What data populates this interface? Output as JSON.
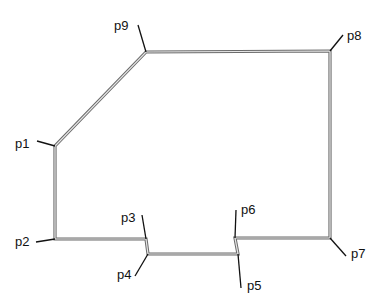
{
  "diagram": {
    "type": "polygon-outline",
    "outline_color_outer": "#6b6b6b",
    "outline_color_inner": "#e6e6e6",
    "leader_color": "#111111",
    "points": [
      {
        "id": "p1",
        "label": "p1",
        "vertex": [
          55,
          146
        ],
        "leader_end": [
          37,
          141
        ],
        "label_pos": [
          15,
          137
        ]
      },
      {
        "id": "p2",
        "label": "p2",
        "vertex": [
          55,
          239
        ],
        "leader_end": [
          36,
          242
        ],
        "label_pos": [
          15,
          235
        ]
      },
      {
        "id": "p3",
        "label": "p3",
        "vertex": [
          146,
          239
        ],
        "leader_end": [
          142,
          215
        ],
        "label_pos": [
          121,
          211
        ]
      },
      {
        "id": "p4",
        "label": "p4",
        "vertex": [
          148,
          254
        ],
        "leader_end": [
          135,
          276
        ],
        "label_pos": [
          117,
          268
        ]
      },
      {
        "id": "p5",
        "label": "p5",
        "vertex": [
          238,
          254
        ],
        "leader_end": [
          241,
          288
        ],
        "label_pos": [
          247,
          279
        ]
      },
      {
        "id": "p6",
        "label": "p6",
        "vertex": [
          235,
          238
        ],
        "leader_end": [
          236,
          210
        ],
        "label_pos": [
          241,
          203
        ]
      },
      {
        "id": "p7",
        "label": "p7",
        "vertex": [
          330,
          238
        ],
        "leader_end": [
          346,
          256
        ],
        "label_pos": [
          351,
          247
        ]
      },
      {
        "id": "p8",
        "label": "p8",
        "vertex": [
          330,
          51
        ],
        "leader_end": [
          343,
          35
        ],
        "label_pos": [
          347,
          29
        ]
      },
      {
        "id": "p9",
        "label": "p9",
        "vertex": [
          146,
          52
        ],
        "leader_end": [
          138,
          25
        ],
        "label_pos": [
          114,
          19
        ]
      }
    ]
  }
}
